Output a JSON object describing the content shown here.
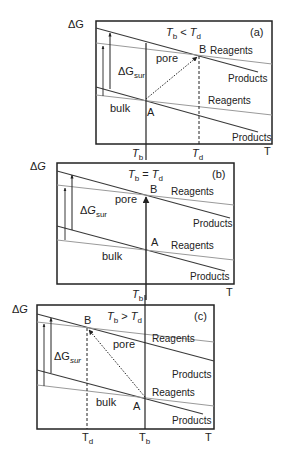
{
  "figure": {
    "axis_label_y": "ΔG",
    "axis_label_x": "T",
    "surface_term_main": "ΔG",
    "surface_term_sub": "sur",
    "label_pore": "pore",
    "label_bulk": "bulk",
    "label_reagents": "Reagents",
    "label_products": "Products",
    "point_a": "A",
    "point_b": "B",
    "tb_main": "T",
    "tb_sub": "b",
    "td_main": "T",
    "td_sub": "d",
    "colors": {
      "products_line": "#3a3a3a",
      "reagents_line": "#9a9a9a",
      "frame": "#222222"
    }
  },
  "panels": [
    {
      "id": "a",
      "tag": "(a)",
      "condition_rel": "<",
      "relation": "Tb < Td"
    },
    {
      "id": "b",
      "tag": "(b)",
      "condition_rel": "=",
      "relation": "Tb = Td"
    },
    {
      "id": "c",
      "tag": "(c)",
      "condition_rel": ">",
      "relation": "Tb > Td"
    }
  ]
}
